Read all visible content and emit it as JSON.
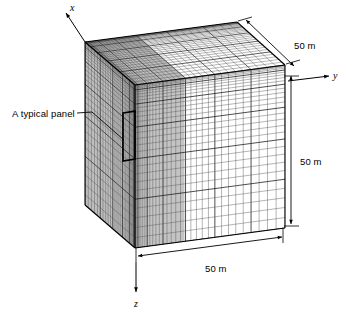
{
  "figure": {
    "type": "3d-mesh-diagram",
    "background_color": "#ffffff",
    "line_color": "#000000",
    "mesh_color": "#4a4a4a",
    "shade_color": "#b8b8b8"
  },
  "axes": [
    {
      "id": "x",
      "label": "x",
      "direction": "up-left",
      "label_x": 70,
      "label_y": 3
    },
    {
      "id": "y",
      "label": "y",
      "direction": "right",
      "label_x": 333,
      "label_y": 71
    },
    {
      "id": "z",
      "label": "z",
      "direction": "down",
      "label_x": 134,
      "label_y": 299
    }
  ],
  "annotations": [
    {
      "id": "typical-panel",
      "text": "A typical panel",
      "x": 12,
      "y": 109
    }
  ],
  "dimensions": [
    {
      "id": "depth",
      "text": "50 m",
      "x": 294,
      "y": 41,
      "edge": "top-right-diagonal"
    },
    {
      "id": "height",
      "text": "50 m",
      "x": 300,
      "y": 157,
      "edge": "right-vertical"
    },
    {
      "id": "width",
      "text": "50 m",
      "x": 205,
      "y": 264,
      "edge": "bottom-horizontal"
    }
  ],
  "geometry": {
    "size_m": 50,
    "corners": {
      "top_back_left": [
        85,
        42
      ],
      "top_back_right": [
        237,
        22
      ],
      "top_front_left": [
        135,
        85
      ],
      "top_front_right": [
        285,
        65
      ],
      "bot_front_left": [
        135,
        248
      ],
      "bot_front_right": [
        285,
        228
      ],
      "bot_back_left": [
        85,
        205
      ]
    },
    "panel": {
      "x": 123,
      "y": 113,
      "w": 12,
      "h": 48
    }
  },
  "mesh": {
    "front_face": {
      "vertical_divisions": 34,
      "horizontal_divisions": 30,
      "grading": "fine-at-left-and-top"
    },
    "top_face": {
      "divisions_u": 34,
      "divisions_v": 30,
      "grading": "fine-at-left-and-back"
    },
    "left_face": {
      "divisions_u": 30,
      "divisions_v": 30,
      "grading": "fine-at-front-and-top"
    }
  }
}
